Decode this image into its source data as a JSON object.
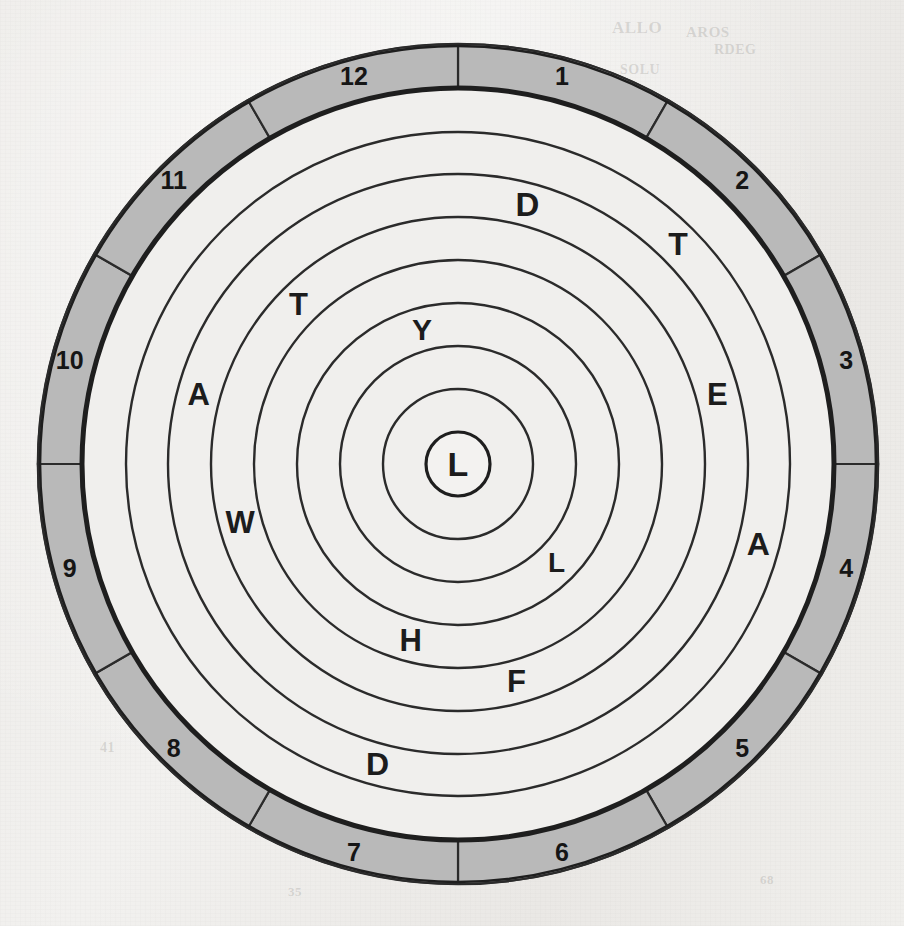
{
  "figure": {
    "name": "clock-letter-wheel",
    "type": "polar-grid-puzzle",
    "center_label": "L",
    "sector_count": 12,
    "ring_count": 8
  },
  "colors": {
    "paper": "#efeeec",
    "ink": "#1c1c1c",
    "line": "#2b2b2b",
    "band_gray": "#b9b9b9",
    "cell_fill": "#f0efed"
  },
  "geometry": {
    "center_x": 458,
    "center_y": 464,
    "radius_outer_circle": 420,
    "radius_band_outer": 376,
    "radius_band_inner": 332,
    "ring_radii": [
      32,
      75,
      118,
      161,
      204,
      247,
      290,
      332,
      376
    ],
    "sector_offset_degrees": -90
  },
  "hour_labels": [
    {
      "value": "1",
      "hour": 1
    },
    {
      "value": "2",
      "hour": 2
    },
    {
      "value": "3",
      "hour": 3
    },
    {
      "value": "4",
      "hour": 4
    },
    {
      "value": "5",
      "hour": 5
    },
    {
      "value": "6",
      "hour": 6
    },
    {
      "value": "7",
      "hour": 7
    },
    {
      "value": "8",
      "hour": 8
    },
    {
      "value": "9",
      "hour": 9
    },
    {
      "value": "10",
      "hour": 10
    },
    {
      "value": "11",
      "hour": 11
    },
    {
      "value": "12",
      "hour": 12
    }
  ],
  "band_sectors": [
    {
      "hour": 1,
      "filled": true
    },
    {
      "hour": 2,
      "filled": true
    },
    {
      "hour": 3,
      "filled": true
    },
    {
      "hour": 4,
      "filled": true
    },
    {
      "hour": 5,
      "filled": true
    },
    {
      "hour": 6,
      "filled": true
    },
    {
      "hour": 7,
      "filled": true
    },
    {
      "hour": 8,
      "filled": true
    },
    {
      "hour": 9,
      "filled": true
    },
    {
      "hour": 10,
      "filled": true
    },
    {
      "hour": 11,
      "filled": true
    },
    {
      "hour": 12,
      "filled": true
    }
  ],
  "letters": [
    {
      "letter": "L",
      "ring": 0,
      "hour": 0,
      "font_size": 34,
      "note": "center hub"
    },
    {
      "letter": "Y",
      "ring": 2,
      "hour": 12,
      "font_size": 30
    },
    {
      "letter": "L",
      "ring": 2,
      "hour": 5,
      "font_size": 28
    },
    {
      "letter": "T",
      "ring": 4,
      "hour": 11,
      "font_size": 31
    },
    {
      "letter": "H",
      "ring": 3,
      "hour": 7,
      "font_size": 31
    },
    {
      "letter": "D",
      "ring": 5,
      "hour": 1,
      "font_size": 33
    },
    {
      "letter": "F",
      "ring": 4,
      "hour": 6,
      "font_size": 31
    },
    {
      "letter": "E",
      "ring": 5,
      "hour": 3,
      "font_size": 31
    },
    {
      "letter": "W",
      "ring": 4,
      "hour": 9,
      "font_size": 31
    },
    {
      "letter": "A",
      "ring": 5,
      "hour": 10,
      "font_size": 31
    },
    {
      "letter": "T",
      "ring": 6,
      "hour": 2,
      "font_size": 32
    },
    {
      "letter": "A",
      "ring": 6,
      "hour": 4,
      "font_size": 32
    },
    {
      "letter": "D",
      "ring": 6,
      "hour": 7,
      "font_size": 32
    }
  ],
  "letter_sequence": "L Y L T H D F E W A T A D",
  "background_ghost_text": [
    {
      "text": "ALLO",
      "x": 612,
      "y": 18,
      "size": 17
    },
    {
      "text": "AROS",
      "x": 686,
      "y": 24,
      "size": 15
    },
    {
      "text": "RDEG",
      "x": 714,
      "y": 42,
      "size": 14
    },
    {
      "text": "SOLU",
      "x": 620,
      "y": 62,
      "size": 14
    },
    {
      "text": "77",
      "x": 214,
      "y": 116,
      "size": 15
    },
    {
      "text": "41",
      "x": 100,
      "y": 740,
      "size": 14
    },
    {
      "text": "35",
      "x": 288,
      "y": 884,
      "size": 13
    },
    {
      "text": "68",
      "x": 760,
      "y": 872,
      "size": 13
    }
  ]
}
